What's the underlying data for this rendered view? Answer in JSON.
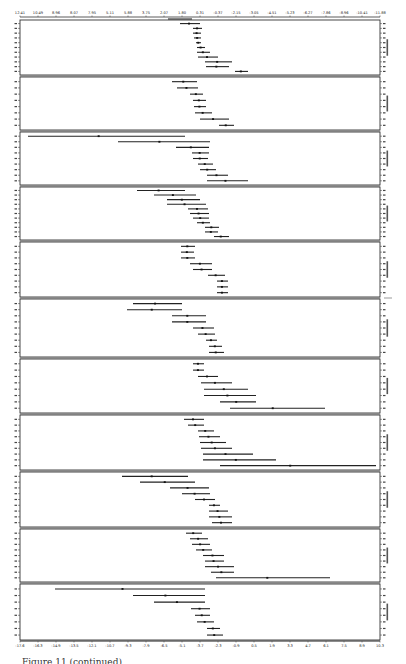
{
  "chart_data": {
    "type": "forest",
    "orientation": "rotated-90",
    "title": "",
    "xlabel": "",
    "ylabel": "",
    "x_ticks_top": [
      "12.41",
      "10.49",
      "8.96",
      "8.07",
      "7.95",
      "5.11",
      "5.88",
      "3.75",
      "2.07",
      "1.80",
      "0.31",
      "-0.37",
      "-2.15",
      "-3.05",
      "-4.51",
      "-5.23",
      "-6.27",
      "-7.86",
      "-8.96",
      "-10.41",
      "-11.88"
    ],
    "x_ticks_bottom": [
      "-17.6",
      "-16.3",
      "-14.9",
      "-13.5",
      "-12.1",
      "-10.7",
      "-9.3",
      "-7.9",
      "-6.5",
      "-5.1",
      "-3.7",
      "-2.3",
      "-0.9",
      "0.5",
      "1.9",
      "3.3",
      "4.7",
      "6.1",
      "7.5",
      "8.9",
      "10.3"
    ],
    "xlim_px": [
      20,
      380
    ],
    "grid": false,
    "legend": "none",
    "panels": [
      {
        "name": "panel-1",
        "y_top": 20,
        "y_bottom": 75,
        "bars_px": [
          [
            180,
            200
          ],
          [
            193,
            202
          ],
          [
            193,
            201
          ],
          [
            194,
            201
          ],
          [
            196,
            201
          ],
          [
            197,
            205
          ],
          [
            197,
            210
          ],
          [
            198,
            218
          ],
          [
            205,
            232
          ],
          [
            206,
            229
          ],
          [
            235,
            248
          ]
        ]
      },
      {
        "name": "panel-2",
        "y_top": 77,
        "y_bottom": 130,
        "bars_px": [
          [
            172,
            197
          ],
          [
            177,
            198
          ],
          [
            190,
            203
          ],
          [
            193,
            206
          ],
          [
            194,
            206
          ],
          [
            195,
            212
          ],
          [
            200,
            229
          ],
          [
            219,
            234
          ]
        ]
      },
      {
        "name": "panel-3",
        "y_top": 132,
        "y_bottom": 185,
        "bars_px": [
          [
            28,
            185
          ],
          [
            118,
            210
          ],
          [
            176,
            209
          ],
          [
            192,
            209
          ],
          [
            193,
            208
          ],
          [
            198,
            213
          ],
          [
            200,
            216
          ],
          [
            207,
            228
          ],
          [
            207,
            248
          ]
        ]
      },
      {
        "name": "panel-4",
        "y_top": 187,
        "y_bottom": 240,
        "bars_px": [
          [
            137,
            185
          ],
          [
            154,
            196
          ],
          [
            167,
            200
          ],
          [
            167,
            206
          ],
          [
            188,
            208
          ],
          [
            190,
            209
          ],
          [
            193,
            209
          ],
          [
            197,
            210
          ],
          [
            205,
            219
          ],
          [
            205,
            218
          ],
          [
            214,
            229
          ]
        ]
      },
      {
        "name": "panel-5",
        "y_top": 242,
        "y_bottom": 297,
        "bars_px": [
          [
            181,
            195
          ],
          [
            181,
            194
          ],
          [
            181,
            195
          ],
          [
            190,
            212
          ],
          [
            193,
            212
          ],
          [
            208,
            225
          ],
          [
            217,
            228
          ],
          [
            217,
            228
          ],
          [
            217,
            228
          ]
        ]
      },
      {
        "name": "panel-6",
        "y_top": 299,
        "y_bottom": 357,
        "bars_px": [
          [
            133,
            182
          ],
          [
            127,
            182
          ],
          [
            172,
            206
          ],
          [
            172,
            206
          ],
          [
            193,
            214
          ],
          [
            198,
            215
          ],
          [
            206,
            217
          ],
          [
            209,
            222
          ],
          [
            209,
            224
          ]
        ]
      },
      {
        "name": "panel-7",
        "y_top": 359,
        "y_bottom": 413,
        "bars_px": [
          [
            193,
            204
          ],
          [
            193,
            204
          ],
          [
            198,
            218
          ],
          [
            201,
            232
          ],
          [
            204,
            248
          ],
          [
            204,
            256
          ],
          [
            220,
            256
          ],
          [
            230,
            325
          ]
        ]
      },
      {
        "name": "panel-8",
        "y_top": 415,
        "y_bottom": 470,
        "bars_px": [
          [
            184,
            204
          ],
          [
            188,
            204
          ],
          [
            198,
            214
          ],
          [
            199,
            220
          ],
          [
            200,
            226
          ],
          [
            201,
            232
          ],
          [
            203,
            253
          ],
          [
            203,
            276
          ],
          [
            220,
            376
          ]
        ]
      },
      {
        "name": "panel-9",
        "y_top": 472,
        "y_bottom": 527,
        "bars_px": [
          [
            122,
            188
          ],
          [
            140,
            195
          ],
          [
            170,
            209
          ],
          [
            182,
            210
          ],
          [
            195,
            215
          ],
          [
            209,
            220
          ],
          [
            209,
            228
          ],
          [
            209,
            232
          ],
          [
            212,
            232
          ]
        ]
      },
      {
        "name": "panel-10",
        "y_top": 529,
        "y_bottom": 582,
        "bars_px": [
          [
            186,
            202
          ],
          [
            190,
            208
          ],
          [
            192,
            210
          ],
          [
            196,
            212
          ],
          [
            203,
            224
          ],
          [
            205,
            224
          ],
          [
            205,
            234
          ],
          [
            211,
            234
          ],
          [
            216,
            330
          ]
        ]
      },
      {
        "name": "panel-11",
        "y_top": 584,
        "y_bottom": 640,
        "bars_px": [
          [
            55,
            205
          ],
          [
            133,
            205
          ],
          [
            154,
            205
          ],
          [
            191,
            210
          ],
          [
            195,
            210
          ],
          [
            197,
            214
          ],
          [
            207,
            220
          ],
          [
            207,
            223
          ]
        ]
      }
    ]
  },
  "caption": {
    "text": "Figure 11 (continued)"
  }
}
